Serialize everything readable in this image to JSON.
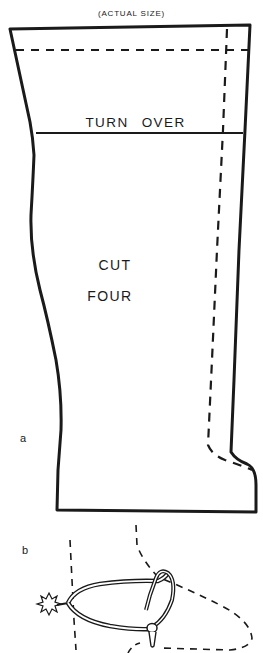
{
  "diagram": {
    "type": "sewing-pattern",
    "title": "(ACTUAL SIZE)",
    "pattern_piece": {
      "figure_label": "a",
      "fold_line_label": "TURN OVER",
      "instruction_line1": "CUT",
      "instruction_line2": "FOUR",
      "lines": {
        "outline": "solid cutting line",
        "seam_top": "dashed horizontal stitching line",
        "seam_side": "dashed vertical stitching line"
      }
    },
    "detail": {
      "figure_label": "b",
      "description": "spur attached to boot heel, dashed boot outline"
    },
    "colors": {
      "ink": "#1a1a1a",
      "paper": "#ffffff"
    }
  }
}
